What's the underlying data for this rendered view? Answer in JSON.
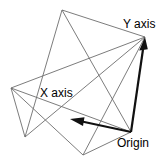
{
  "diagram": {
    "background_color": "#ffffff",
    "polygon_stroke_color": "#6d6d6d",
    "axis_color": "#111111",
    "labels": {
      "y_axis": "Y axis",
      "x_axis": "X axis",
      "origin": "Origin"
    },
    "points": {
      "apex": [
        62,
        10
      ],
      "left": [
        11,
        88
      ],
      "bottom_left": [
        25,
        137
      ],
      "bottom_mid": [
        83,
        155
      ],
      "origin": [
        131,
        132
      ],
      "y_tip": [
        145,
        37
      ],
      "x_tip": [
        70,
        119
      ]
    },
    "polygon_paths": [
      "62,10 25,137 11,88 131,132 83,155 145,37 62,10",
      "11,88 145,37",
      "62,10 131,132"
    ],
    "axes": [
      {
        "name": "y-axis",
        "from": [
          131,
          132
        ],
        "to": [
          145,
          37
        ],
        "label": "Y axis"
      },
      {
        "name": "x-axis",
        "from": [
          131,
          132
        ],
        "to": [
          70,
          119
        ],
        "label": "X axis"
      }
    ]
  }
}
